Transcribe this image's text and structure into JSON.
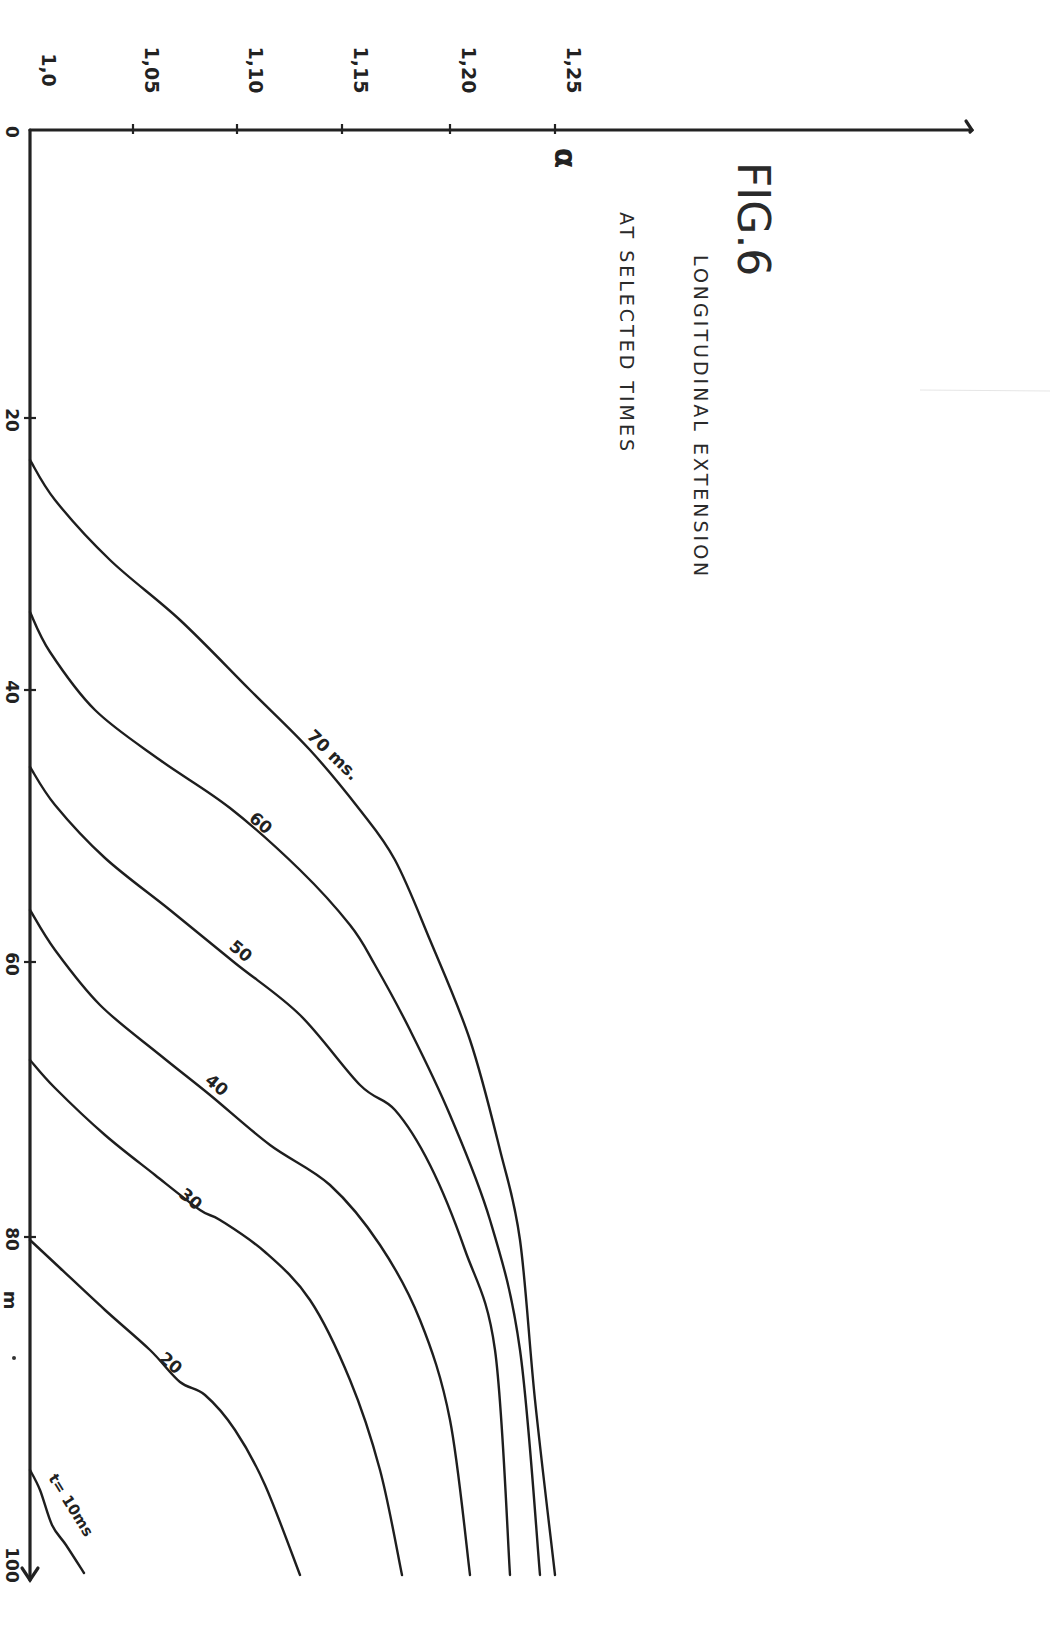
{
  "figure": {
    "number_label": "FIG.6",
    "title_line1": "LONGITUDINAL EXTENSION",
    "title_line2": "AT SELECTED TIMES"
  },
  "axes": {
    "alpha": {
      "label": "α",
      "ticks": [
        {
          "label": "1,0",
          "value": 1.0,
          "px": 30
        },
        {
          "label": "1,05",
          "value": 1.05,
          "px": 133
        },
        {
          "label": "1,10",
          "value": 1.1,
          "px": 237
        },
        {
          "label": "1,15",
          "value": 1.15,
          "px": 342
        },
        {
          "label": "1,20",
          "value": 1.2,
          "px": 450
        },
        {
          "label": "1,25",
          "value": 1.25,
          "px": 555
        }
      ],
      "line": {
        "y": 130,
        "x_start": 30,
        "x_end": 972
      }
    },
    "position": {
      "label": "m",
      "ticks": [
        {
          "label": "0",
          "value": 0,
          "px": 130
        },
        {
          "label": "20",
          "value": 20,
          "px": 418
        },
        {
          "label": "40",
          "value": 40,
          "px": 690
        },
        {
          "label": "60",
          "value": 60,
          "px": 962
        },
        {
          "label": "80",
          "value": 80,
          "px": 1237
        },
        {
          "label": "100",
          "value": 100,
          "px": 1515
        }
      ],
      "line": {
        "x": 30,
        "y_start": 130,
        "y_end": 1580
      }
    }
  },
  "chart_data": {
    "type": "line",
    "title": "FIG.6 LONGITUDINAL EXTENSION AT SELECTED TIMES",
    "xlabel": "position (m), 0–100 (drawn vertical, downward)",
    "ylabel": "α (longitudinal extension ratio), 1.0–1.25 (drawn horizontal)",
    "orientation": "rotated 90°: position axis runs down the page, α axis runs across the top",
    "x_range": [
      0,
      100
    ],
    "y_range": [
      1.0,
      1.25
    ],
    "grid": false,
    "legend": "inline curve labels",
    "series": [
      {
        "name": "t = 10 ms",
        "label": "t= 10ms",
        "points_data": [
          [
            98,
            1.0
          ],
          [
            101,
            1.01
          ],
          [
            103,
            1.025
          ]
        ]
      },
      {
        "name": "20 ms",
        "label": "20",
        "points_data": [
          [
            80,
            1.0
          ],
          [
            85,
            1.05
          ],
          [
            91,
            1.075
          ],
          [
            96,
            1.1
          ],
          [
            100,
            1.13
          ]
        ]
      },
      {
        "name": "30 ms",
        "label": "30",
        "points_data": [
          [
            67,
            1.0
          ],
          [
            73,
            1.05
          ],
          [
            79,
            1.085
          ],
          [
            86,
            1.115
          ],
          [
            93,
            1.135
          ],
          [
            100,
            1.175
          ]
        ]
      },
      {
        "name": "40 ms",
        "label": "40",
        "points_data": [
          [
            56,
            1.0
          ],
          [
            62,
            1.05
          ],
          [
            68,
            1.09
          ],
          [
            75,
            1.14
          ],
          [
            83,
            1.18
          ],
          [
            92,
            1.195
          ],
          [
            100,
            1.205
          ]
        ]
      },
      {
        "name": "50 ms",
        "label": "50",
        "points_data": [
          [
            46,
            1.0
          ],
          [
            52,
            1.04
          ],
          [
            60,
            1.09
          ],
          [
            68,
            1.15
          ],
          [
            75,
            1.185
          ],
          [
            85,
            1.21
          ],
          [
            100,
            1.225
          ]
        ]
      },
      {
        "name": "60 ms",
        "label": "60",
        "points_data": [
          [
            34,
            1.0
          ],
          [
            41,
            1.04
          ],
          [
            50,
            1.1
          ],
          [
            57,
            1.155
          ],
          [
            64,
            1.185
          ],
          [
            75,
            1.215
          ],
          [
            100,
            1.235
          ]
        ]
      },
      {
        "name": "70 ms",
        "label": "70 ms.",
        "points_data": [
          [
            23,
            1.0
          ],
          [
            30,
            1.05
          ],
          [
            39,
            1.11
          ],
          [
            47,
            1.165
          ],
          [
            52,
            1.185
          ],
          [
            60,
            1.205
          ],
          [
            75,
            1.225
          ],
          [
            100,
            1.24
          ]
        ]
      }
    ]
  },
  "curves_px": [
    {
      "id": "t10",
      "label": "t= 10ms",
      "label_pos": [
        48,
        1478
      ],
      "label_rot": 58,
      "label_size": 15,
      "points": [
        [
          30,
          1470
        ],
        [
          40,
          1490
        ],
        [
          52,
          1525
        ],
        [
          66,
          1545
        ],
        [
          84,
          1573
        ]
      ]
    },
    {
      "id": "t20",
      "label": "20",
      "label_pos": [
        158,
        1360
      ],
      "label_rot": 40,
      "label_size": 17,
      "points": [
        [
          30,
          1240
        ],
        [
          60,
          1268
        ],
        [
          105,
          1310
        ],
        [
          150,
          1350
        ],
        [
          180,
          1382
        ],
        [
          205,
          1395
        ],
        [
          235,
          1430
        ],
        [
          265,
          1485
        ],
        [
          300,
          1575
        ]
      ]
    },
    {
      "id": "t30",
      "label": "30",
      "label_pos": [
        178,
        1196
      ],
      "label_rot": 40,
      "label_size": 17,
      "points": [
        [
          30,
          1060
        ],
        [
          55,
          1088
        ],
        [
          105,
          1135
        ],
        [
          155,
          1175
        ],
        [
          200,
          1210
        ],
        [
          220,
          1220
        ],
        [
          265,
          1252
        ],
        [
          310,
          1300
        ],
        [
          350,
          1380
        ],
        [
          380,
          1470
        ],
        [
          402,
          1575
        ]
      ]
    },
    {
      "id": "t40",
      "label": "40",
      "label_pos": [
        204,
        1082
      ],
      "label_rot": 40,
      "label_size": 17,
      "points": [
        [
          30,
          910
        ],
        [
          55,
          950
        ],
        [
          100,
          1005
        ],
        [
          160,
          1055
        ],
        [
          210,
          1095
        ],
        [
          270,
          1145
        ],
        [
          330,
          1185
        ],
        [
          380,
          1245
        ],
        [
          420,
          1320
        ],
        [
          450,
          1420
        ],
        [
          470,
          1575
        ]
      ]
    },
    {
      "id": "t50",
      "label": "50",
      "label_pos": [
        228,
        948
      ],
      "label_rot": 40,
      "label_size": 17,
      "points": [
        [
          30,
          767
        ],
        [
          55,
          805
        ],
        [
          105,
          858
        ],
        [
          170,
          910
        ],
        [
          235,
          963
        ],
        [
          300,
          1015
        ],
        [
          360,
          1085
        ],
        [
          395,
          1110
        ],
        [
          430,
          1165
        ],
        [
          465,
          1250
        ],
        [
          495,
          1350
        ],
        [
          510,
          1575
        ]
      ]
    },
    {
      "id": "t60",
      "label": "60",
      "label_pos": [
        248,
        820
      ],
      "label_rot": 40,
      "label_size": 17,
      "points": [
        [
          30,
          612
        ],
        [
          50,
          652
        ],
        [
          95,
          710
        ],
        [
          160,
          760
        ],
        [
          230,
          808
        ],
        [
          300,
          870
        ],
        [
          350,
          925
        ],
        [
          375,
          965
        ],
        [
          410,
          1030
        ],
        [
          450,
          1115
        ],
        [
          490,
          1220
        ],
        [
          520,
          1350
        ],
        [
          540,
          1575
        ]
      ]
    },
    {
      "id": "t70",
      "label": "70 ms.",
      "label_pos": [
        306,
        737
      ],
      "label_rot": 44,
      "label_size": 17,
      "points": [
        [
          30,
          460
        ],
        [
          55,
          500
        ],
        [
          110,
          560
        ],
        [
          180,
          620
        ],
        [
          250,
          690
        ],
        [
          310,
          750
        ],
        [
          360,
          810
        ],
        [
          395,
          860
        ],
        [
          430,
          940
        ],
        [
          470,
          1040
        ],
        [
          500,
          1150
        ],
        [
          520,
          1240
        ],
        [
          535,
          1400
        ],
        [
          555,
          1575
        ]
      ]
    }
  ],
  "colors": {
    "ink": "#1e1e1e",
    "paper": "#ffffff"
  }
}
